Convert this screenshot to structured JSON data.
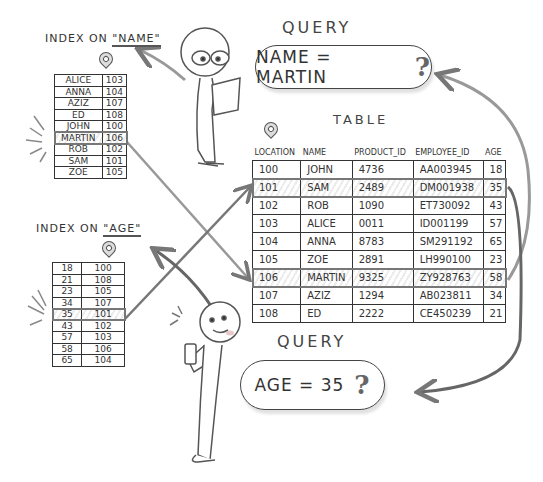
{
  "name_index": {
    "title_prefix": "INDEX ON ",
    "title_field": "\"NAME\"",
    "rows": [
      [
        "ALICE",
        "103"
      ],
      [
        "ANNA",
        "104"
      ],
      [
        "AZIZ",
        "107"
      ],
      [
        "ED",
        "108"
      ],
      [
        "JOHN",
        "100"
      ],
      [
        "MARTIN",
        "106"
      ],
      [
        "ROB",
        "102"
      ],
      [
        "SAM",
        "101"
      ],
      [
        "ZOE",
        "105"
      ]
    ],
    "highlighted_row": 5
  },
  "age_index": {
    "title_prefix": "INDEX ON ",
    "title_field": "\"AGE\"",
    "rows": [
      [
        "18",
        "100"
      ],
      [
        "21",
        "108"
      ],
      [
        "23",
        "105"
      ],
      [
        "34",
        "107"
      ],
      [
        "35",
        "101"
      ],
      [
        "43",
        "102"
      ],
      [
        "57",
        "103"
      ],
      [
        "58",
        "106"
      ],
      [
        "65",
        "104"
      ]
    ],
    "highlighted_row": 4
  },
  "table": {
    "title": "TABLE",
    "columns": [
      "LOCATION",
      "NAME",
      "PRODUCT_ID",
      "EMPLOYEE_ID",
      "AGE"
    ],
    "rows": [
      [
        "100",
        "JOHN",
        "4736",
        "AA003945",
        "18"
      ],
      [
        "101",
        "SAM",
        "2489",
        "DM001938",
        "35"
      ],
      [
        "102",
        "ROB",
        "1090",
        "ET730092",
        "43"
      ],
      [
        "103",
        "ALICE",
        "0011",
        "ID001199",
        "57"
      ],
      [
        "104",
        "ANNA",
        "8783",
        "SM291192",
        "65"
      ],
      [
        "105",
        "ZOE",
        "2891",
        "LH990100",
        "23"
      ],
      [
        "106",
        "MARTIN",
        "9325",
        "ZY928763",
        "58"
      ],
      [
        "107",
        "AZIZ",
        "1294",
        "AB023811",
        "34"
      ],
      [
        "108",
        "ED",
        "2222",
        "CE450239",
        "21"
      ]
    ],
    "highlighted_rows": [
      1,
      6
    ]
  },
  "query_name": {
    "title": "QUERY",
    "text": "NAME = MARTIN",
    "mark": "?"
  },
  "query_age": {
    "title": "QUERY",
    "text": "AGE = 35",
    "mark": "?"
  },
  "colors": {
    "ink": "#333333",
    "arrow": "#777777",
    "highlight": "#777777"
  }
}
